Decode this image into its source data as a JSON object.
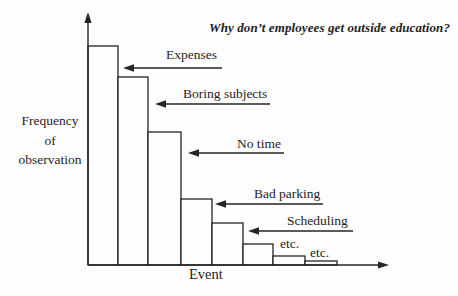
{
  "title": "Why don’t employees get outside education?",
  "axes": {
    "y_label_lines": [
      "Frequency",
      "of",
      "observation"
    ],
    "x_label": "Event"
  },
  "annotations": [
    {
      "label": "Expenses"
    },
    {
      "label": "Boring subjects"
    },
    {
      "label": "No time"
    },
    {
      "label": "Bad parking"
    },
    {
      "label": "Scheduling"
    },
    {
      "label": "etc."
    },
    {
      "label": "etc."
    }
  ],
  "colors": {
    "background": "#fdfdfd",
    "ink": "#242424"
  },
  "chart_data": {
    "type": "bar",
    "title": "Why don’t employees get outside education?",
    "xlabel": "Event",
    "ylabel": "Frequency of observation",
    "categories": [
      "Expenses",
      "Boring subjects",
      "No time",
      "Bad parking",
      "Scheduling",
      "etc.",
      "etc.",
      ""
    ],
    "values": [
      219,
      188,
      133,
      66,
      42,
      21,
      9,
      4
    ],
    "value_scale": "relative frequency (y-axis unlabeled)",
    "bar_fill": "#fdfdfd",
    "grid": false,
    "legend": "none",
    "annotation_style": "left-pointing arrows from each label to its bar"
  }
}
